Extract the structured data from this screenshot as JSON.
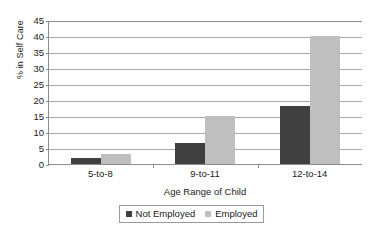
{
  "chart_data": {
    "type": "bar",
    "title": "",
    "subtitle": "",
    "xlabel": "Age Range of Child",
    "ylabel": "% in Self Care",
    "categories": [
      "5-to-8",
      "9-to-11",
      "12-to-14"
    ],
    "series": [
      {
        "name": "Not Employed",
        "color": "#404040",
        "values": [
          2,
          6.5,
          18
        ]
      },
      {
        "name": "Employed",
        "color": "#bfbfbf",
        "values": [
          3,
          15,
          40
        ]
      }
    ],
    "ylim": [
      0,
      45
    ],
    "ytick_step": 5,
    "yticks": [
      45,
      40,
      35,
      30,
      25,
      20,
      15,
      10,
      5,
      0
    ],
    "grid": "horizontal",
    "legend_position": "bottom-center",
    "legend_entries": [
      "Not Employed",
      "Employed"
    ]
  },
  "colors": {
    "axis": "#8c8c8c",
    "gridline": "#a8a8a8",
    "text": "#1a1a1a",
    "background": "#ffffff",
    "not_employed": "#404040",
    "employed": "#bfbfbf"
  }
}
